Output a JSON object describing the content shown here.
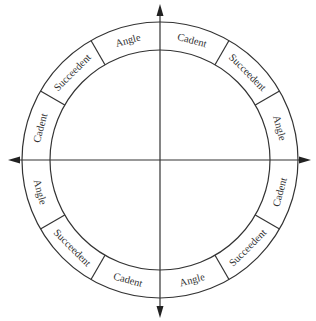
{
  "diagram": {
    "type": "house-wheel",
    "center": {
      "x": 160,
      "y": 160
    },
    "outer_radius": 138,
    "inner_radius": 110,
    "stroke_color": "#333333",
    "text_color": "#333333",
    "axes": {
      "vertical": {
        "top_tip_y": 4,
        "bottom_tip_y": 318
      },
      "horizontal": {
        "left_tip_x": 8,
        "right_tip_x": 311
      }
    },
    "divider_angles_deg": [
      30,
      60,
      120,
      150,
      210,
      240,
      300,
      330
    ],
    "segments": [
      {
        "label": "Angle",
        "mid_angle_deg": 105
      },
      {
        "label": "Cadent",
        "mid_angle_deg": 75
      },
      {
        "label": "Succeedent",
        "mid_angle_deg": 45
      },
      {
        "label": "Angle",
        "mid_angle_deg": 15
      },
      {
        "label": "Cadent",
        "mid_angle_deg": -15
      },
      {
        "label": "Succeedent",
        "mid_angle_deg": -45
      },
      {
        "label": "Angle",
        "mid_angle_deg": -75
      },
      {
        "label": "Cadent",
        "mid_angle_deg": -105
      },
      {
        "label": "Succeedent",
        "mid_angle_deg": -135
      },
      {
        "label": "Angle",
        "mid_angle_deg": -165
      },
      {
        "label": "Cadent",
        "mid_angle_deg": 165
      },
      {
        "label": "Succeedent",
        "mid_angle_deg": 135
      }
    ]
  }
}
